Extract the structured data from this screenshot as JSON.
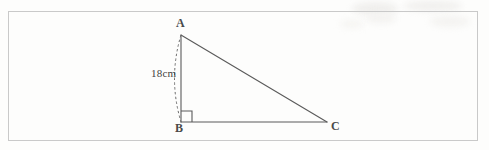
{
  "figure": {
    "stroke_color": "#5a5a5a",
    "dash_color": "#6b6b6b",
    "background": "#fdfdfc",
    "border_color": "#c9c9c9",
    "vertices": [
      {
        "name": "A",
        "label": "A",
        "x": 181,
        "y": 35
      },
      {
        "name": "B",
        "label": "B",
        "x": 181,
        "y": 122
      },
      {
        "name": "C",
        "label": "C",
        "x": 327,
        "y": 122
      }
    ],
    "edges": [
      {
        "name": "side-ab",
        "from": "A",
        "to": "B",
        "style": "solid"
      },
      {
        "name": "side-bc",
        "from": "B",
        "to": "C",
        "style": "solid"
      },
      {
        "name": "side-ac",
        "from": "A",
        "to": "C",
        "style": "solid"
      }
    ],
    "right_angle": {
      "at": "B",
      "size": 11
    },
    "arc": {
      "name": "dashed-arc-ab",
      "from": "A",
      "to": "B",
      "style": "dashed",
      "bulge_direction": "left"
    },
    "measurement": {
      "label": "18cm",
      "applies_to": "arc-ab"
    }
  }
}
